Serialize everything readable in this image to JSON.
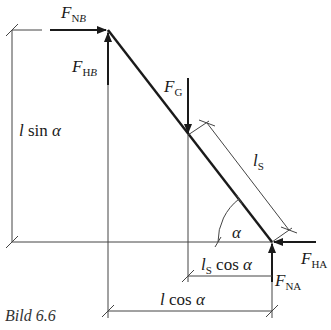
{
  "figure": {
    "caption": "Bild 6.6",
    "colors": {
      "line": "#1a1a1a",
      "thin": "#444444",
      "background": "#ffffff"
    },
    "forces": {
      "F_NB": {
        "main": "F",
        "sub_upright": "N",
        "sub_italic": "B"
      },
      "F_HB": {
        "main": "F",
        "sub_upright": "H",
        "sub_italic": "B"
      },
      "F_G": {
        "main": "F",
        "sub_upright": "G"
      },
      "F_HA": {
        "main": "F",
        "sub_upright": "HA"
      },
      "F_NA": {
        "main": "F",
        "sub_upright": "NA"
      }
    },
    "dimensions": {
      "l_sin_alpha": {
        "l": "l",
        "fn": " sin ",
        "angle": "α"
      },
      "l_S": {
        "l": "l",
        "sub": "S"
      },
      "l_S_cos_alpha": {
        "l": "l",
        "sub": "S",
        "fn": " cos ",
        "angle": "α"
      },
      "l_cos_alpha": {
        "l": "l",
        "fn": " cos ",
        "angle": "α"
      }
    },
    "angle_label": "α"
  }
}
